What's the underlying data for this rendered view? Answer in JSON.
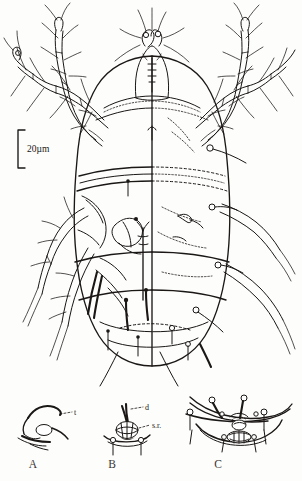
{
  "figure": {
    "kind": "scientific-line-drawing",
    "background_color": "#fdfdfc",
    "ink_color": "#1a1715",
    "description_visible_text_only": true
  },
  "scale_bar": {
    "label": "20µm",
    "orientation": "vertical",
    "bracket": true
  },
  "main_view": {
    "midline_note": "split view: left half ventral (solid), right half dorsal (dashed)",
    "leg_pairs": 4,
    "segments_visible": 4
  },
  "panels": [
    {
      "id": "A",
      "letter": "A",
      "labels": [
        {
          "text": "t"
        }
      ]
    },
    {
      "id": "B",
      "letter": "B",
      "labels": [
        {
          "text": "d"
        },
        {
          "text": "s.r."
        }
      ]
    },
    {
      "id": "C",
      "letter": "C",
      "labels": []
    }
  ],
  "colors": {
    "ink": "#1a1715",
    "panel_letter": "#3a3735",
    "paper": "#fdfdfc"
  }
}
